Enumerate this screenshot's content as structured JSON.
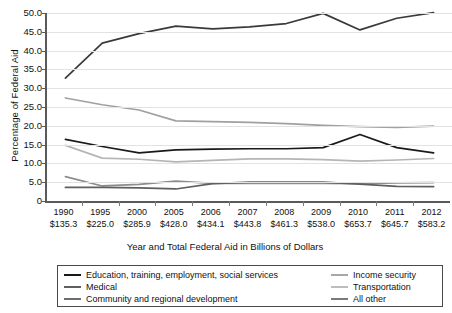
{
  "chart_data": {
    "type": "line",
    "title": "",
    "xlabel": "Year and Total Federal Aid in Billions of Dollars",
    "ylabel": "Percentage of Federal Aid",
    "ylim": [
      0,
      50
    ],
    "yticks": [
      "0",
      "5.0",
      "10.0",
      "15.0",
      "20.0",
      "25.0",
      "30.0",
      "35.0",
      "40.0",
      "45.0",
      "50.0"
    ],
    "grid": true,
    "legend_position": "bottom",
    "categories": [
      "1990",
      "1995",
      "2000",
      "2005",
      "2006",
      "2007",
      "2008",
      "2009",
      "2010",
      "2011",
      "2012"
    ],
    "category_sublabels": [
      "$135.3",
      "$225.0",
      "$285.9",
      "$428.0",
      "$434.1",
      "$443.8",
      "$461.3",
      "$538.0",
      "$653.7",
      "$645.7",
      "$583.2"
    ],
    "series": [
      {
        "name": "Medical",
        "color": "#3a3a3a",
        "values": [
          32.7,
          42.0,
          44.5,
          46.5,
          45.8,
          46.3,
          47.2,
          49.9,
          45.5,
          48.6,
          50.1
        ]
      },
      {
        "name": "Income security",
        "color": "#a0a0a0",
        "values": [
          27.4,
          25.6,
          24.2,
          21.3,
          21.1,
          20.9,
          20.6,
          20.1,
          19.8,
          19.6,
          19.9
        ]
      },
      {
        "name": "Education, training, employment, social services",
        "color": "#1a1a1a",
        "values": [
          16.4,
          14.5,
          12.8,
          13.6,
          13.8,
          13.9,
          13.9,
          14.2,
          17.7,
          14.2,
          12.8
        ]
      },
      {
        "name": "Transportation",
        "color": "#b5b5b5",
        "values": [
          14.8,
          11.4,
          11.1,
          10.4,
          10.8,
          11.2,
          11.2,
          11.0,
          10.6,
          10.9,
          11.3
        ]
      },
      {
        "name": "All other",
        "color": "#8c8c8c",
        "values": [
          6.5,
          4.0,
          4.4,
          5.3,
          4.7,
          4.7,
          4.7,
          4.7,
          4.6,
          4.8,
          4.9
        ]
      },
      {
        "name": "Community and regional development",
        "color": "#5f5f5f",
        "values": [
          3.6,
          3.6,
          3.5,
          3.2,
          4.6,
          5.0,
          5.0,
          5.0,
          4.5,
          3.9,
          3.8
        ]
      }
    ]
  },
  "legend": {
    "left_items": [
      {
        "label": "Education, training, employment, social services",
        "color": "#1a1a1a"
      },
      {
        "label": "Medical",
        "color": "#5f5f5f"
      },
      {
        "label": "Community and regional development",
        "color": "#6e6e6e"
      }
    ],
    "right_items": [
      {
        "label": "Income security",
        "color": "#a8a8a8"
      },
      {
        "label": "Transportation",
        "color": "#bdbdbd"
      },
      {
        "label": "All other",
        "color": "#7a7a7a"
      }
    ]
  }
}
